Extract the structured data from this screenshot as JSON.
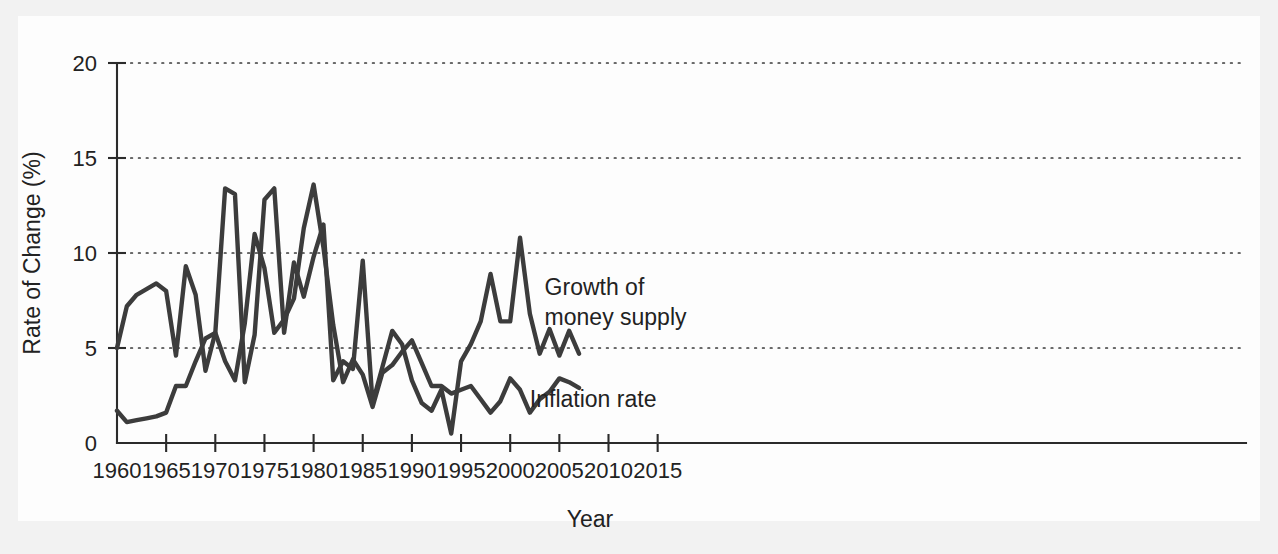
{
  "chart_data": {
    "type": "line",
    "title": "",
    "xlabel": "Year",
    "ylabel": "Rate of Change (%)",
    "xlim": [
      1960,
      2016
    ],
    "ylim": [
      0,
      20
    ],
    "xticks": [
      1960,
      1965,
      1970,
      1975,
      1980,
      1985,
      1990,
      1995,
      2000,
      2005,
      2010,
      2015
    ],
    "yticks": [
      0,
      5,
      10,
      15,
      20
    ],
    "xtick_labels": [
      "1960",
      "1965",
      "1970",
      "1975",
      "1980",
      "1985",
      "1990",
      "1995",
      "2000",
      "2005",
      "2010",
      "2015"
    ],
    "ytick_labels": [
      "0",
      "5",
      "10",
      "15",
      "20"
    ],
    "grid": "horizontal-dotted",
    "legend_position": "inline-annotation",
    "x": [
      1960,
      1961,
      1962,
      1963,
      1964,
      1965,
      1966,
      1967,
      1968,
      1969,
      1970,
      1971,
      1972,
      1973,
      1974,
      1975,
      1976,
      1977,
      1978,
      1979,
      1980,
      1981,
      1982,
      1983,
      1984,
      1985,
      1986,
      1987,
      1988,
      1989,
      1990,
      1991,
      1992,
      1993,
      1994,
      1995,
      1996,
      1997,
      1998,
      1999,
      2000,
      2001,
      2002,
      2003,
      2004,
      2005,
      2006,
      2007
    ],
    "series": [
      {
        "name": "Growth of money supply",
        "annotation": "Growth of\nmoney supply",
        "annotation_lines": [
          "Growth of",
          "money supply"
        ],
        "color": "#3c3c3c",
        "values": [
          5.0,
          7.2,
          7.8,
          8.1,
          8.4,
          8.0,
          4.6,
          9.3,
          7.8,
          3.8,
          5.8,
          13.4,
          13.1,
          3.2,
          5.7,
          12.8,
          13.4,
          5.8,
          9.5,
          7.7,
          9.8,
          11.5,
          3.3,
          4.3,
          3.9,
          9.6,
          2.1,
          4.0,
          5.9,
          5.2,
          3.3,
          2.1,
          1.7,
          2.8,
          0.5,
          4.3,
          5.2,
          6.4,
          8.9,
          6.4,
          6.4,
          10.8,
          6.8,
          4.7,
          6.0,
          4.6,
          5.9,
          4.7
        ]
      },
      {
        "name": "Inflation rate",
        "annotation": "Inflation rate",
        "annotation_lines": [
          "Inflation rate"
        ],
        "color": "#3c3c3c",
        "values": [
          1.7,
          1.1,
          1.2,
          1.3,
          1.4,
          1.6,
          3.0,
          3.0,
          4.3,
          5.5,
          5.8,
          4.3,
          3.3,
          6.3,
          11.0,
          9.2,
          5.8,
          6.5,
          7.6,
          11.3,
          13.6,
          10.3,
          6.2,
          3.2,
          4.4,
          3.6,
          1.9,
          3.7,
          4.1,
          4.8,
          5.4,
          4.2,
          3.0,
          3.0,
          2.6,
          2.8,
          3.0,
          2.3,
          1.6,
          2.2,
          3.4,
          2.8,
          1.6,
          2.3,
          2.7,
          3.4,
          3.2,
          2.9
        ]
      }
    ],
    "annotations": [
      {
        "id": "money-supply-label",
        "lines": [
          "Growth of",
          "money supply"
        ],
        "x": 2003.5,
        "y": 7.8
      },
      {
        "id": "inflation-label",
        "lines": [
          "Inflation rate"
        ],
        "x": 2002.0,
        "y": 1.9
      }
    ]
  }
}
